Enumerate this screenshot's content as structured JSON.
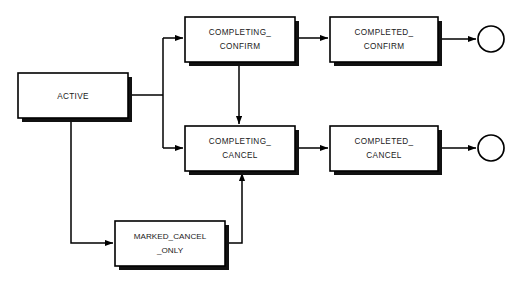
{
  "diagram": {
    "background_color": "#ffffff",
    "stroke_color": "#000000",
    "text_color": "#1a1a1a",
    "nodes": [
      {
        "id": "active",
        "line1": "ACTIVE",
        "line2": "",
        "x": 18,
        "y": 73,
        "w": 110,
        "h": 45
      },
      {
        "id": "completing_confirm",
        "line1": "COMPLETING_",
        "line2": "CONFIRM",
        "x": 185,
        "y": 17,
        "w": 110,
        "h": 45
      },
      {
        "id": "completed_confirm",
        "line1": "COMPLETED_",
        "line2": "CONFIRM",
        "x": 330,
        "y": 17,
        "w": 108,
        "h": 45
      },
      {
        "id": "completing_cancel",
        "line1": "COMPLETING_",
        "line2": "CANCEL",
        "x": 185,
        "y": 126,
        "w": 110,
        "h": 45
      },
      {
        "id": "completed_cancel",
        "line1": "COMPLETED_",
        "line2": "CANCEL",
        "x": 330,
        "y": 126,
        "w": 108,
        "h": 45
      },
      {
        "id": "marked_cancel_only",
        "line1": "MARKED_CANCEL",
        "line2": "_ONLY",
        "x": 115,
        "y": 221,
        "w": 110,
        "h": 45
      }
    ],
    "end_states": [
      {
        "id": "end-confirm",
        "cx": 491,
        "cy": 39,
        "r": 13
      },
      {
        "id": "end-cancel",
        "cx": 491,
        "cy": 148,
        "r": 13
      }
    ],
    "edges": [
      {
        "id": "active-to-split",
        "from": "active",
        "to": "split"
      },
      {
        "id": "split-to-completing-confirm",
        "from": "active",
        "to": "completing_confirm"
      },
      {
        "id": "split-to-completing-cancel",
        "from": "active",
        "to": "completing_cancel"
      },
      {
        "id": "active-to-marked-cancel-only",
        "from": "active",
        "to": "marked_cancel_only"
      },
      {
        "id": "completing-confirm-to-completing-cancel",
        "from": "completing_confirm",
        "to": "completing_cancel"
      },
      {
        "id": "completing-confirm-to-completed-confirm",
        "from": "completing_confirm",
        "to": "completed_confirm"
      },
      {
        "id": "completing-cancel-to-completed-cancel",
        "from": "completing_cancel",
        "to": "completed_cancel"
      },
      {
        "id": "marked-cancel-only-to-completing-cancel",
        "from": "marked_cancel_only",
        "to": "completing_cancel"
      },
      {
        "id": "completed-confirm-to-end",
        "from": "completed_confirm",
        "to": "end-confirm"
      },
      {
        "id": "completed-cancel-to-end",
        "from": "completed_cancel",
        "to": "end-cancel"
      }
    ]
  }
}
